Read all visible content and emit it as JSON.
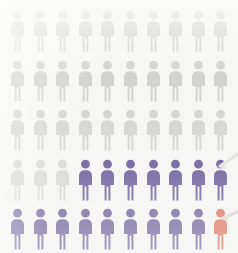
{
  "figure_icon": "person-pictogram-icon",
  "palette": {
    "background": "#f6f6f4",
    "inactive": "#c9c9c9",
    "highlight": "#2c1a72",
    "alert": "#d4331a",
    "pointer": "#cfcfcf"
  },
  "chart_data": {
    "type": "pictogram",
    "title": "",
    "subtitle": "",
    "xlabel": "",
    "ylabel": "",
    "unit_label": "person",
    "unit_value": 1,
    "total_units": 50,
    "rows": 5,
    "columns": 10,
    "categories": [
      "inactive",
      "highlight",
      "alert"
    ],
    "category_labels": [
      "Gray (unhighlighted)",
      "Navy (highlighted group)",
      "Red (single highlighted case)"
    ],
    "category_colors": [
      "#c9c9c9",
      "#2c1a72",
      "#d4331a"
    ],
    "values": [
      33,
      16,
      1
    ],
    "percentages": [
      66,
      32,
      2
    ],
    "legend_position": "none",
    "grid": false,
    "grid_layout": [
      [
        "inactive",
        "inactive",
        "inactive",
        "inactive",
        "inactive",
        "inactive",
        "inactive",
        "inactive",
        "inactive",
        "inactive"
      ],
      [
        "inactive",
        "inactive",
        "inactive",
        "inactive",
        "inactive",
        "inactive",
        "inactive",
        "inactive",
        "inactive",
        "inactive"
      ],
      [
        "inactive",
        "inactive",
        "inactive",
        "inactive",
        "inactive",
        "inactive",
        "inactive",
        "inactive",
        "inactive",
        "inactive"
      ],
      [
        "inactive",
        "inactive",
        "inactive",
        "highlight",
        "highlight",
        "highlight",
        "highlight",
        "highlight",
        "highlight",
        "highlight"
      ],
      [
        "highlight",
        "highlight",
        "highlight",
        "highlight",
        "highlight",
        "highlight",
        "highlight",
        "highlight",
        "highlight",
        "alert"
      ]
    ],
    "annotations": [
      {
        "name": "pointer-to-last-highlight",
        "target_row": 4,
        "target_column": 10,
        "direction": "from-right"
      },
      {
        "name": "pointer-to-alert",
        "target_row": 5,
        "target_column": 10,
        "direction": "from-right"
      }
    ]
  },
  "layout": {
    "origin_x": 9,
    "origin_y": 10,
    "column_step": 22.6,
    "row_step": 49.5,
    "figure_width": 17,
    "figure_height": 42
  }
}
